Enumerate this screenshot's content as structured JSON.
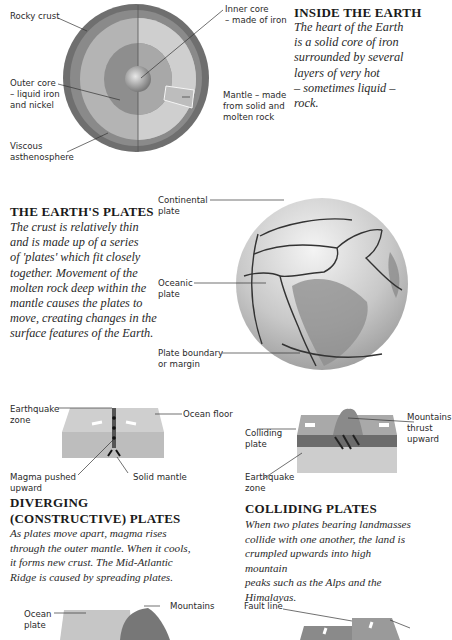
{
  "inside_earth": {
    "heading": "INSIDE THE EARTH",
    "body": "The heart of the Earth\nis a solid core of iron\nsurrounded by several\nlayers of very hot\n– sometimes liquid – rock.",
    "labels": {
      "rocky_crust": "Rocky crust",
      "inner_core": "Inner core\n– made of iron",
      "outer_core": "Outer core\n– liquid iron\nand nickel",
      "mantle": "Mantle – made\nfrom solid and\nmolten rock",
      "asthenosphere": "Viscous\nasthenosphere"
    }
  },
  "earth_plates": {
    "heading": "THE EARTH'S PLATES",
    "body": "The crust is relatively thin\nand is made up of a series\nof 'plates' which fit closely\ntogether. Movement of the\nmolten rock deep within the\nmantle causes the plates to\nmove, creating changes in the\nsurface features of the Earth.",
    "labels": {
      "continental": "Continental\nplate",
      "oceanic": "Oceanic\nplate",
      "boundary": "Plate boundary\nor margin"
    }
  },
  "diverging": {
    "heading_line1": "DIVERGING",
    "heading_line2": "(CONSTRUCTIVE) PLATES",
    "body": "As plates move apart, magma rises\nthrough the outer mantle. When it cools,\nit forms new crust. The Mid-Atlantic\nRidge is caused by spreading plates.",
    "labels": {
      "earthquake_zone": "Earthquake\nzone",
      "ocean_floor": "Ocean floor",
      "magma": "Magma pushed\nupward",
      "solid_mantle": "Solid mantle"
    }
  },
  "colliding": {
    "heading": "COLLIDING PLATES",
    "body": "When two plates bearing landmasses\ncollide with one another, the land is\ncrumpled upwards into high mountain\npeaks such as the Alps and the Himalayas.",
    "labels": {
      "colliding_plate": "Colliding\nplate",
      "earthquake_zone": "Earthquake\nzone",
      "mountains_pushed": "Mountains\nthrust\nupward"
    }
  },
  "bottom": {
    "labels": {
      "ocean_plate": "Ocean\nplate",
      "mountains": "Mountains",
      "fault_line": "Fault line"
    }
  }
}
